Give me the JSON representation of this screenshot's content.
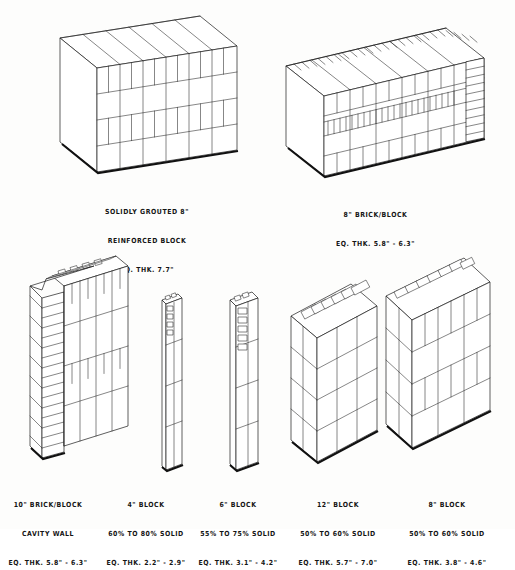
{
  "sheet": {
    "title_present": false,
    "background_color": "#fdfdfc",
    "ink_color": "#1a1a1a"
  },
  "figures": [
    {
      "id": "solid-grouted-block-wall",
      "position": "top-left",
      "drawing_type": "axonometric-wall",
      "caption_lines": [
        "SOLIDLY GROUTED 8\"",
        "REINFORCED BLOCK",
        "EQ. THK. 7.7\""
      ],
      "nominal_size": "8\"",
      "wall_kind": "solidly grouted reinforced block",
      "equivalent_thickness": "7.7\"",
      "percent_solid": null,
      "courses": 4,
      "top_shows_cores": false
    },
    {
      "id": "brick-block-composite-wall",
      "position": "top-right",
      "drawing_type": "axonometric-wall",
      "caption_lines": [
        "8\" BRICK/BLOCK",
        "EQ. THK. 5.8\" - 6.3\""
      ],
      "nominal_size": "8\"",
      "wall_kind": "brick/block composite",
      "equivalent_thickness": "5.8\" - 6.3\"",
      "percent_solid": null,
      "courses": 4,
      "top_shows_cores": true
    },
    {
      "id": "brick-block-cavity-wall",
      "position": "bottom-1",
      "drawing_type": "axonometric-wall",
      "caption_lines": [
        "10\" BRICK/BLOCK",
        "CAVITY WALL",
        "EQ. THK. 5.8\" - 6.3\""
      ],
      "nominal_size": "10\"",
      "wall_kind": "brick/block cavity wall",
      "equivalent_thickness": "5.8\" - 6.3\"",
      "percent_solid": null,
      "courses": 5,
      "top_shows_cores": true
    },
    {
      "id": "four-inch-block-wall",
      "position": "bottom-2",
      "drawing_type": "axonometric-wall",
      "caption_lines": [
        "4\" BLOCK",
        "60% TO 80% SOLID",
        "EQ. THK. 2.2\" - 2.9\""
      ],
      "nominal_size": "4\"",
      "wall_kind": "hollow block",
      "equivalent_thickness": "2.2\" - 2.9\"",
      "percent_solid": "60% TO 80% SOLID",
      "courses": 4,
      "top_shows_cores": true
    },
    {
      "id": "six-inch-block-wall",
      "position": "bottom-3",
      "drawing_type": "axonometric-wall",
      "caption_lines": [
        "6\" BLOCK",
        "55% TO 75% SOLID",
        "EQ. THK. 3.1\" - 4.2\""
      ],
      "nominal_size": "6\"",
      "wall_kind": "hollow block",
      "equivalent_thickness": "3.1\" - 4.2\"",
      "percent_solid": "55% TO 75% SOLID",
      "courses": 4,
      "top_shows_cores": true
    },
    {
      "id": "twelve-inch-block-wall",
      "position": "bottom-4",
      "drawing_type": "axonometric-wall",
      "caption_lines": [
        "12\" BLOCK",
        "50% TO 60% SOLID",
        "EQ. THK. 5.7\" - 7.0\""
      ],
      "nominal_size": "12\"",
      "wall_kind": "hollow block",
      "equivalent_thickness": "5.7\" - 7.0\"",
      "percent_solid": "50% TO 60% SOLID",
      "courses": 4,
      "top_shows_cores": true
    },
    {
      "id": "eight-inch-block-wall",
      "position": "bottom-5",
      "drawing_type": "axonometric-wall",
      "caption_lines": [
        "8\" BLOCK",
        "50% TO 60% SOLID",
        "EQ. THK. 3.8\" - 4.6\""
      ],
      "nominal_size": "8\"",
      "wall_kind": "hollow block",
      "equivalent_thickness": "3.8\" - 4.6\"",
      "percent_solid": "50% TO 60% SOLID",
      "courses": 4,
      "top_shows_cores": true
    }
  ]
}
